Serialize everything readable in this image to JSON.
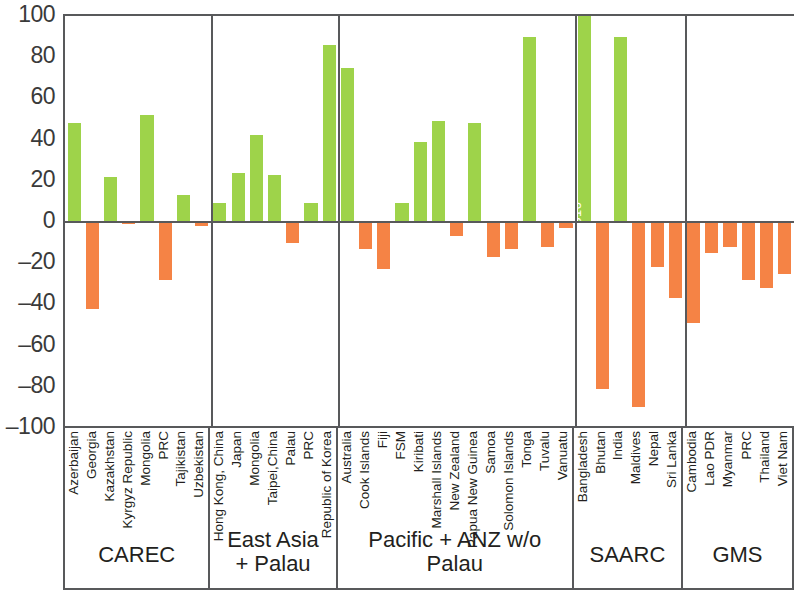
{
  "chart_data": {
    "type": "bar",
    "title": "",
    "xlabel": "",
    "ylabel": "",
    "ylim": [
      -100,
      100
    ],
    "yticks": [
      100,
      80,
      60,
      40,
      20,
      0,
      -20,
      -40,
      -60,
      -80,
      -100
    ],
    "grid": false,
    "legend": "none",
    "colors": {
      "positive": "#9ed34a",
      "negative": "#f58345",
      "axis": "#58595b",
      "text": "#231f20"
    },
    "groups": [
      {
        "name": "CAREC",
        "categories": [
          "Azerbaijan",
          "Georgia",
          "Kazakhstan",
          "Kyrgyz Republic",
          "Mongolia",
          "PRC",
          "Tajikistan",
          "Uzbekistan"
        ],
        "values": [
          48,
          -42,
          22,
          -1,
          52,
          -28,
          13,
          -2
        ],
        "labels": [
          "",
          "",
          "",
          "",
          "",
          "",
          "",
          ""
        ]
      },
      {
        "name": "East Asia\n+ Palau",
        "categories": [
          "Hong Kong, China",
          "Japan",
          "Mongolia",
          "Taipei,China",
          "Palau",
          "PRC",
          "Republic of Korea"
        ],
        "values": [
          9,
          24,
          42,
          23,
          -10,
          9,
          86
        ],
        "labels": [
          "",
          "",
          "",
          "",
          "",
          "",
          ""
        ]
      },
      {
        "name": "Pacific + ANZ w/o Palau",
        "categories": [
          "Australia",
          "Cook Islands",
          "Fiji",
          "FSM",
          "Kiribati",
          "Marshall Islands",
          "New Zealand",
          "Papua New Guinea",
          "Samoa",
          "Solomon Islands",
          "Tonga",
          "Tuvalu",
          "Vanuatu"
        ],
        "values": [
          75,
          -13,
          -23,
          9,
          39,
          49,
          -7,
          48,
          -17,
          -13,
          90,
          -12,
          -3
        ],
        "labels": [
          "",
          "",
          "",
          "",
          "",
          "",
          "",
          "",
          "",
          "",
          "",
          "",
          ""
        ]
      },
      {
        "name": "SAARC",
        "categories": [
          "Bangladesh",
          "Bhutan",
          "India",
          "Maldives",
          "Nepal",
          "Sri Lanka"
        ],
        "values": [
          100,
          -81,
          90,
          -90,
          -22,
          -37
        ],
        "labels": [
          "1,310",
          "",
          "",
          "",
          "",
          ""
        ]
      },
      {
        "name": "GMS",
        "categories": [
          "Cambodia",
          "Lao PDR",
          "Myanmar",
          "PRC",
          "Thailand",
          "Viet Nam"
        ],
        "values": [
          -49,
          -15,
          -12,
          -28,
          -32,
          -25
        ],
        "labels": [
          "",
          "",
          "",
          "",
          "",
          ""
        ]
      }
    ]
  }
}
